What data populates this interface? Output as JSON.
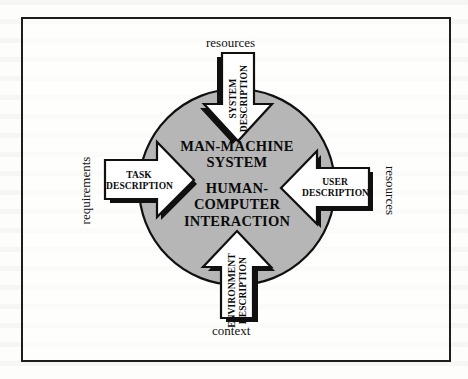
{
  "figure": {
    "type": "concept-diagram",
    "title": "",
    "center": {
      "line1": "MAN-MACHINE",
      "line2": "SYSTEM",
      "line3": "HUMAN-",
      "line4": "COMPUTER",
      "line5": "INTERACTION"
    },
    "colors": {
      "circle_fill": "#b6b6b6",
      "circle_stroke": "#101010",
      "arrow_fill": "#ffffff",
      "arrow_stroke": "#101010",
      "shadow": "#101010",
      "frame": "#1d1d1d",
      "page": "#fdfdfb",
      "text": "#0a0a0a"
    },
    "arrows": [
      {
        "id": "top",
        "direction": "down",
        "label_line1": "SYSTEM",
        "label_line2": "DESCRIPTION",
        "outer_label": "resources",
        "outer_label_position": "top",
        "text_orientation": "vertical-up"
      },
      {
        "id": "left",
        "direction": "right",
        "label_line1": "TASK",
        "label_line2": "DESCRIPTION",
        "outer_label": "requirements",
        "outer_label_position": "left",
        "text_orientation": "horizontal"
      },
      {
        "id": "right",
        "direction": "left",
        "label_line1": "USER",
        "label_line2": "DESCRIPTION",
        "outer_label": "resources",
        "outer_label_position": "right",
        "text_orientation": "horizontal"
      },
      {
        "id": "bottom",
        "direction": "up",
        "label_line1": "ENVIRONMENT",
        "label_line2": "DESCRIPTION",
        "outer_label": "context",
        "outer_label_position": "bottom",
        "text_orientation": "vertical-up"
      }
    ]
  }
}
